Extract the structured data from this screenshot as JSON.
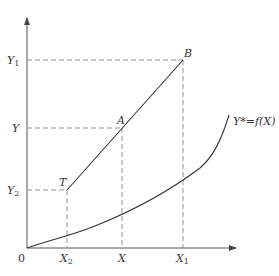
{
  "diagram": {
    "origin_label": "0",
    "x_ticks": [
      {
        "id": "X2",
        "main": "X",
        "sub": "2",
        "x": 67
      },
      {
        "id": "X",
        "main": "X",
        "sub": "",
        "x": 122
      },
      {
        "id": "X1",
        "main": "X",
        "sub": "1",
        "x": 183
      }
    ],
    "y_ticks": [
      {
        "id": "Y1",
        "main": "Y",
        "sub": "1",
        "y": 60
      },
      {
        "id": "Y",
        "main": "Y",
        "sub": "",
        "y": 128
      },
      {
        "id": "Y2",
        "main": "Y",
        "sub": "2",
        "y": 190
      }
    ],
    "points": [
      {
        "label": "T",
        "x": 67,
        "y": 190
      },
      {
        "label": "A",
        "x": 122,
        "y": 128
      },
      {
        "label": "B",
        "x": 183,
        "y": 60
      }
    ],
    "curve_label": "Y*=f(X)",
    "colors": {
      "axis": "#555555",
      "line": "#333333",
      "dash": "#888888",
      "text": "#333333"
    }
  }
}
